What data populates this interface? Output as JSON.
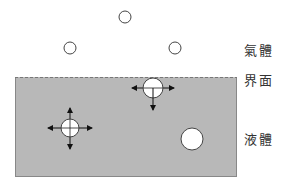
{
  "labels": {
    "gas": "氣體",
    "interface": "界面",
    "liquid": "液體"
  },
  "colors": {
    "liquid_fill": "#b8b8b8",
    "liquid_border": "#888888",
    "molecule_fill": "#ffffff",
    "molecule_stroke": "#444444",
    "arrow": "#111111"
  },
  "gas_molecules": [
    {
      "cx": 125,
      "cy": 17,
      "r": 6
    },
    {
      "cx": 70,
      "cy": 48,
      "r": 6
    },
    {
      "cx": 175,
      "cy": 48,
      "r": 6
    }
  ],
  "surface_molecule": {
    "cx": 153,
    "cy": 88,
    "r": 10,
    "force_arrows": [
      "left",
      "right",
      "down"
    ]
  },
  "bulk_molecule": {
    "cx": 70,
    "cy": 128,
    "r": 9,
    "force_arrows": [
      "up",
      "down",
      "left",
      "right"
    ]
  },
  "plain_liquid_molecule": {
    "cx": 192,
    "cy": 139,
    "r": 11
  }
}
